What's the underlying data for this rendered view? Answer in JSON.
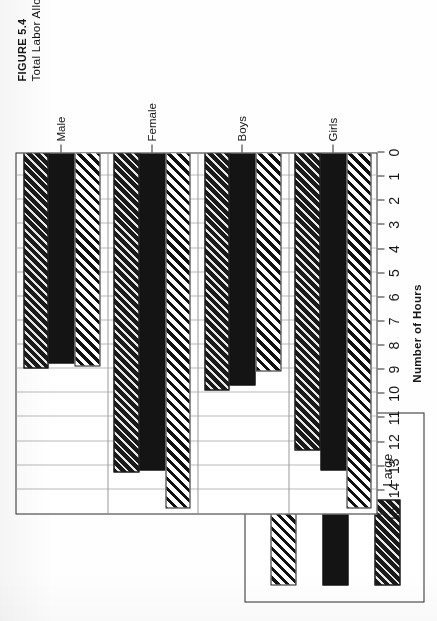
{
  "figure": {
    "number_label": "FIGURE 5.4",
    "caption": "Total Labor Allocation by Age, Sex, and Size of Holding"
  },
  "legend": {
    "items": [
      {
        "label": "Small",
        "pattern": "diagonal-hatch-light",
        "color": "#111111"
      },
      {
        "label": "Medium",
        "pattern": "solid-black",
        "color": "#141414"
      },
      {
        "label": "Large",
        "pattern": "diagonal-hatch-dense",
        "color": "#1a1a1a"
      }
    ]
  },
  "chart_data": {
    "type": "bar",
    "orientation": "horizontal",
    "title": "",
    "xlabel": "",
    "ylabel": "Number of Hours",
    "categories": [
      "Male",
      "Female",
      "Boys",
      "Girls"
    ],
    "series": [
      {
        "name": "Small",
        "values": [
          8.9,
          14.8,
          9.1,
          14.8
        ]
      },
      {
        "name": "Medium",
        "values": [
          8.8,
          13.2,
          9.7,
          13.2
        ]
      },
      {
        "name": "Large",
        "values": [
          9.0,
          13.3,
          9.9,
          12.4
        ]
      }
    ],
    "value_axis": {
      "label": "Number of Hours",
      "min": 0,
      "max": 15,
      "tick_step": 1,
      "ticks": [
        15,
        14,
        13,
        12,
        11,
        10,
        9,
        8,
        7,
        6,
        5,
        4,
        3,
        2,
        1,
        0
      ],
      "direction": "right-to-left"
    },
    "grid": true,
    "legend_position": "above-left"
  }
}
